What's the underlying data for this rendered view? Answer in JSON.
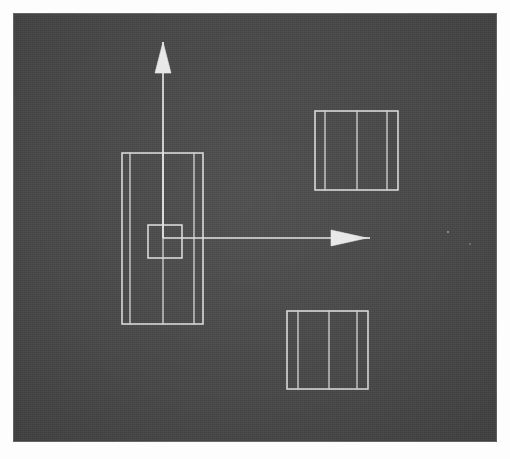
{
  "figure": {
    "canvas": {
      "background_color": "#4a4a4a",
      "paper_color": "#fdfdfd",
      "line_color": "#d8d8d8",
      "margin_px": 13,
      "width_px": 484,
      "height_px": 429
    },
    "axes": {
      "origin": {
        "x": 163,
        "y": 238
      },
      "vertical": {
        "name": "vertical-axis-arrow",
        "from": {
          "x": 163,
          "y": 238
        },
        "to": {
          "x": 163,
          "y": 72
        },
        "tip": {
          "x": 163,
          "y": 42
        },
        "head_width": 16,
        "head_length": 30,
        "direction": "up"
      },
      "horizontal": {
        "name": "horizontal-axis-arrow",
        "from": {
          "x": 163,
          "y": 238
        },
        "to": {
          "x": 330,
          "y": 238
        },
        "tip": {
          "x": 367,
          "y": 238
        },
        "head_width": 16,
        "head_length": 37,
        "direction": "right"
      }
    },
    "shapes": [
      {
        "id": "front-view",
        "label": "Front view outer rectangle",
        "type": "rectangle",
        "x": 122,
        "y": 153,
        "width": 81,
        "height": 171,
        "inner_vertical_lines": [
          130,
          194
        ]
      },
      {
        "id": "front-view-feature",
        "label": "Centered square feature",
        "type": "rectangle",
        "x": 148,
        "y": 225,
        "width": 34,
        "height": 33,
        "inner_vertical_lines": []
      },
      {
        "id": "top-right-view",
        "label": "Upper auxiliary view",
        "type": "rectangle",
        "x": 315,
        "y": 111,
        "width": 83,
        "height": 79,
        "inner_vertical_lines": [
          325,
          357,
          387
        ]
      },
      {
        "id": "bottom-right-view",
        "label": "Lower auxiliary view",
        "type": "rectangle",
        "x": 287,
        "y": 311,
        "width": 81,
        "height": 78,
        "inner_vertical_lines": [
          298,
          329,
          357
        ]
      }
    ],
    "artifacts": [
      {
        "id": "speck-1",
        "x": 448,
        "y": 232,
        "r": 1.1
      },
      {
        "id": "speck-2",
        "x": 470,
        "y": 244,
        "r": 0.8
      }
    ]
  }
}
